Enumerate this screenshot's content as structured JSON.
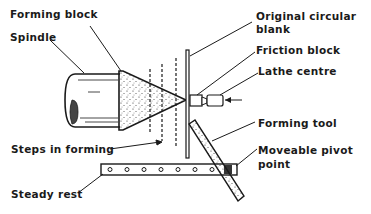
{
  "diagram": {
    "type": "spinning-lathe-forming-setup",
    "labels": {
      "forming_block": "Forming block",
      "spindle": "Spindle",
      "original_blank_line1": "Original circular",
      "original_blank_line2": "blank",
      "friction_block": "Friction block",
      "lathe_centre": "Lathe centre",
      "steps_in_forming": "Steps in forming",
      "forming_tool": "Forming tool",
      "pivot_line1": "Moveable pivot",
      "pivot_line2": "point",
      "steady_rest": "Steady rest"
    },
    "colors": {
      "ink": "#1a1a1a",
      "background": "#ffffff"
    },
    "steady_rest_holes": 8
  }
}
